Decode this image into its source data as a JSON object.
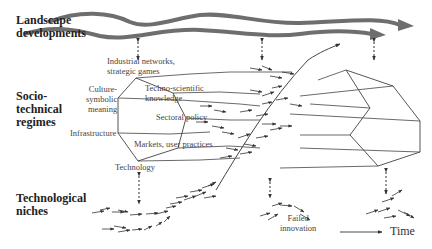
{
  "levels": {
    "landscape": [
      "Landscape",
      "developments"
    ],
    "regimes": [
      "Socio-",
      "technical",
      "regimes"
    ],
    "niches": [
      "Technological",
      "niches"
    ]
  },
  "regime_dimensions": {
    "industrial": [
      "Industrial networks,",
      "strategic games"
    ],
    "culture": [
      "Culture-",
      "symbolic",
      "meaning"
    ],
    "techno": [
      "Techno-scientific",
      "knowledge"
    ],
    "sectoral": "Sectoral policy",
    "infrastructure": "Infrastructure",
    "markets": "Markets, user practices",
    "technology": "Technology"
  },
  "annotations": {
    "failed_innovation": [
      "Failed",
      "innovation"
    ],
    "time": "Time"
  },
  "colors": {
    "landscape_arrow": "#6e6e6e",
    "lines": "#555555",
    "text": "#222222"
  }
}
